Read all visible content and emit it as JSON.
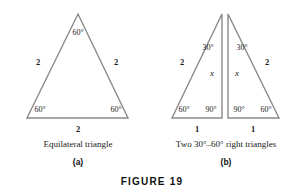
{
  "figure": {
    "title": "FIGURE 19",
    "stroke_color": "#8a8a8a",
    "text_color": "#1a1a1a",
    "background_color": "#ffffff"
  },
  "panel_a": {
    "letter": "(a)",
    "caption": "Equilateral triangle",
    "angles": {
      "apex": "60°",
      "bottom_left": "60°",
      "bottom_right": "60°"
    },
    "sides": {
      "left": "2",
      "right": "2",
      "base": "2"
    }
  },
  "panel_b": {
    "letter": "(b)",
    "caption": "Two 30°–60° right triangles",
    "left_triangle": {
      "angle_apex": "30°",
      "angle_bottom_left": "60°",
      "angle_bottom_right": "90°",
      "side_hypotenuse": "2",
      "side_vertical": "x",
      "side_base": "1"
    },
    "right_triangle": {
      "angle_apex": "30°",
      "angle_bottom_left": "90°",
      "angle_bottom_right": "60°",
      "side_hypotenuse": "2",
      "side_vertical": "x",
      "side_base": "1"
    }
  }
}
